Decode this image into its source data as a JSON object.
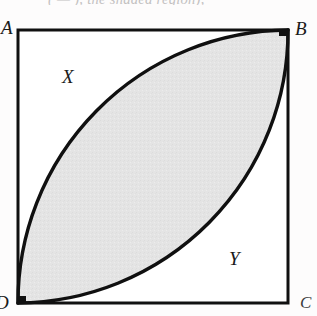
{
  "figure": {
    "caption_fragment": "( — ), the shaded region),",
    "square": {
      "vertices": [
        {
          "name": "A",
          "label": "A",
          "position": "top-left",
          "x": 18,
          "y": 30
        },
        {
          "name": "B",
          "label": "B",
          "position": "top-right",
          "x": 288,
          "y": 30
        },
        {
          "name": "C",
          "label": "C",
          "position": "bottom-right",
          "x": 288,
          "y": 303
        },
        {
          "name": "D",
          "label": "D",
          "position": "bottom-left",
          "x": 18,
          "y": 303
        }
      ],
      "side_px": 270,
      "stroke_color": "#101010",
      "stroke_width": 3,
      "fill_color": "#ffffff"
    },
    "arcs": [
      {
        "name": "arc-from-A",
        "center_vertex": "A",
        "from_vertex": "D",
        "to_vertex": "B",
        "radius_px": 270,
        "stroke_color": "#101010",
        "stroke_width": 3.4
      },
      {
        "name": "arc-from-C",
        "center_vertex": "C",
        "from_vertex": "D",
        "to_vertex": "B",
        "radius_px": 270,
        "stroke_color": "#101010",
        "stroke_width": 3.4
      }
    ],
    "shaded_region": {
      "name": "lens",
      "description": "lens (vesica) bounded by the two arcs between D and B",
      "fill_color": "#e4e4e4"
    },
    "region_labels": [
      {
        "name": "X",
        "label": "X",
        "location": "upper-left region outside lens",
        "x": 65,
        "y": 78
      },
      {
        "name": "Y",
        "label": "Y",
        "location": "lower-right region outside lens",
        "x": 232,
        "y": 260
      }
    ],
    "colors": {
      "ink": "#101010",
      "shade": "#e4e4e4",
      "page": "#fdfcfc"
    }
  }
}
